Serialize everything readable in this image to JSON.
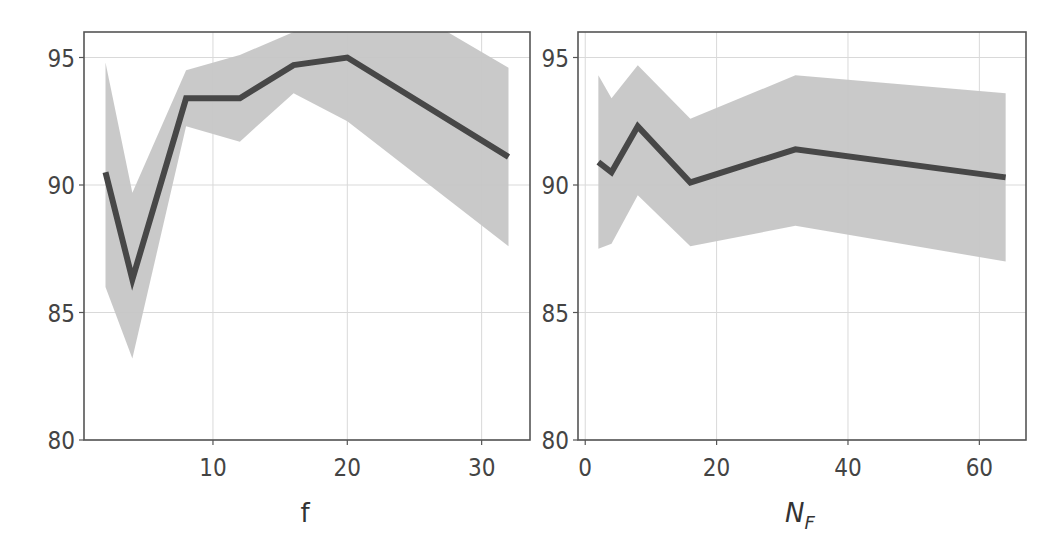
{
  "figure": {
    "panels": [
      {
        "xlabel": "f",
        "xlabel_italic": false,
        "xticks": [
          10,
          20,
          30
        ],
        "yticks": [
          80,
          85,
          90,
          95
        ]
      },
      {
        "xlabel": "N",
        "xlabel_sub": "F",
        "xlabel_italic": true,
        "xticks": [
          0,
          20,
          40,
          60
        ],
        "yticks": [
          80,
          85,
          90,
          95
        ]
      }
    ]
  },
  "chart_data": [
    {
      "type": "line",
      "title": "",
      "xlabel": "f",
      "ylabel": "",
      "x": [
        2,
        4,
        8,
        12,
        16,
        20,
        32
      ],
      "series": [
        {
          "name": "mean",
          "values": [
            90.5,
            86.3,
            93.4,
            93.4,
            94.7,
            95.0,
            91.1
          ],
          "color": "#474747"
        },
        {
          "name": "band_upper",
          "values": [
            94.8,
            89.7,
            94.5,
            95.1,
            96.0,
            98.3,
            94.6
          ],
          "color": "#c6c6c6"
        },
        {
          "name": "band_lower",
          "values": [
            86.0,
            83.2,
            92.3,
            91.7,
            93.6,
            92.5,
            87.6
          ],
          "color": "#c6c6c6"
        }
      ],
      "xlim": [
        0.4,
        33.6
      ],
      "ylim": [
        80,
        96.0
      ],
      "xticks": [
        10,
        20,
        30
      ],
      "yticks": [
        80,
        85,
        90,
        95
      ],
      "grid": true,
      "legend": null
    },
    {
      "type": "line",
      "title": "",
      "xlabel": "N_F",
      "ylabel": "",
      "x": [
        2,
        4,
        8,
        16,
        32,
        64
      ],
      "series": [
        {
          "name": "mean",
          "values": [
            90.9,
            90.5,
            92.3,
            90.1,
            91.4,
            90.3
          ],
          "color": "#474747"
        },
        {
          "name": "band_upper",
          "values": [
            94.3,
            93.4,
            94.7,
            92.6,
            94.3,
            93.6
          ],
          "color": "#c6c6c6"
        },
        {
          "name": "band_lower",
          "values": [
            87.5,
            87.7,
            89.6,
            87.6,
            88.4,
            87.0
          ],
          "color": "#c6c6c6"
        }
      ],
      "xlim": [
        -1.1,
        67.1
      ],
      "ylim": [
        80,
        96.0
      ],
      "xticks": [
        0,
        20,
        40,
        60
      ],
      "yticks": [
        80,
        85,
        90,
        95
      ],
      "grid": true,
      "legend": null
    }
  ]
}
